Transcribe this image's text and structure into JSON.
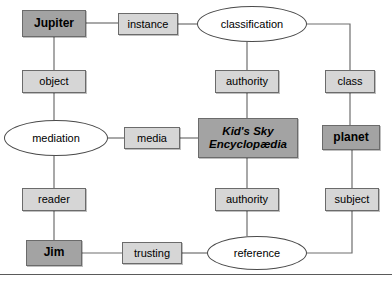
{
  "diagram": {
    "style": {
      "background": "#ffffff",
      "node_light_fill": "#d6d6d6",
      "node_dark_fill": "#a3a3a3",
      "ellipse_fill": "#ffffff",
      "edge_color": "#6e6e6e",
      "text_color": "#000000"
    },
    "nodes": [
      {
        "id": "jupiter",
        "label": "Jupiter",
        "shape": "box",
        "fill": "dark",
        "text": "bold",
        "x": 22,
        "y": 10,
        "w": 64,
        "h": 27
      },
      {
        "id": "instance",
        "label": "instance",
        "shape": "box",
        "fill": "light",
        "text": "plain",
        "x": 118,
        "y": 13,
        "w": 60,
        "h": 22
      },
      {
        "id": "classification",
        "label": "classification",
        "shape": "ellipse",
        "fill": "white",
        "text": "plain",
        "x": 197,
        "y": 6,
        "w": 110,
        "h": 36
      },
      {
        "id": "object",
        "label": "object",
        "shape": "box",
        "fill": "light",
        "text": "plain",
        "x": 22,
        "y": 70,
        "w": 64,
        "h": 23
      },
      {
        "id": "authority_top",
        "label": "authority",
        "shape": "box",
        "fill": "light",
        "text": "plain",
        "x": 215,
        "y": 70,
        "w": 64,
        "h": 23
      },
      {
        "id": "class",
        "label": "class",
        "shape": "box",
        "fill": "light",
        "text": "plain",
        "x": 325,
        "y": 70,
        "w": 50,
        "h": 23
      },
      {
        "id": "mediation",
        "label": "mediation",
        "shape": "ellipse",
        "fill": "white",
        "text": "plain",
        "x": 4,
        "y": 120,
        "w": 104,
        "h": 36
      },
      {
        "id": "media",
        "label": "media",
        "shape": "box",
        "fill": "light",
        "text": "plain",
        "x": 124,
        "y": 127,
        "w": 56,
        "h": 22
      },
      {
        "id": "encyclopaedia",
        "label": "Kid's Sky\nEncyclopædia",
        "shape": "box",
        "fill": "dark",
        "text": "bolditalic",
        "x": 198,
        "y": 118,
        "w": 100,
        "h": 40
      },
      {
        "id": "planet",
        "label": "planet",
        "shape": "box",
        "fill": "dark",
        "text": "bold",
        "x": 322,
        "y": 125,
        "w": 58,
        "h": 25
      },
      {
        "id": "reader",
        "label": "reader",
        "shape": "box",
        "fill": "light",
        "text": "plain",
        "x": 22,
        "y": 188,
        "w": 64,
        "h": 23
      },
      {
        "id": "authority_bot",
        "label": "authority",
        "shape": "box",
        "fill": "light",
        "text": "plain",
        "x": 215,
        "y": 188,
        "w": 64,
        "h": 23
      },
      {
        "id": "subject",
        "label": "subject",
        "shape": "box",
        "fill": "light",
        "text": "plain",
        "x": 325,
        "y": 188,
        "w": 54,
        "h": 23
      },
      {
        "id": "jim",
        "label": "Jim",
        "shape": "box",
        "fill": "dark",
        "text": "bold",
        "x": 26,
        "y": 240,
        "w": 56,
        "h": 26
      },
      {
        "id": "trusting",
        "label": "trusting",
        "shape": "box",
        "fill": "light",
        "text": "plain",
        "x": 122,
        "y": 242,
        "w": 60,
        "h": 22
      },
      {
        "id": "reference",
        "label": "reference",
        "shape": "ellipse",
        "fill": "white",
        "text": "plain",
        "x": 207,
        "y": 236,
        "w": 100,
        "h": 34
      }
    ],
    "edges": [
      {
        "id": "jupiter-instance",
        "from": "jupiter",
        "to": "instance",
        "path": "M 86,23 L 118,23"
      },
      {
        "id": "instance-classification",
        "from": "instance",
        "to": "classification",
        "path": "M 178,24 L 197,24"
      },
      {
        "id": "jupiter-object",
        "from": "jupiter",
        "to": "object",
        "path": "M 54,37 L 54,70"
      },
      {
        "id": "classification-authority",
        "from": "classification",
        "to": "authority_top",
        "path": "M 247,42 L 247,70"
      },
      {
        "id": "classification-class",
        "from": "classification",
        "to": "class",
        "path": "M 307,24 L 350,24 L 350,70"
      },
      {
        "id": "object-mediation",
        "from": "object",
        "to": "mediation",
        "path": "M 54,93 L 54,120"
      },
      {
        "id": "authority-encyclopaedia",
        "from": "authority_top",
        "to": "encyclopaedia",
        "path": "M 247,93 L 247,118"
      },
      {
        "id": "class-planet",
        "from": "class",
        "to": "planet",
        "path": "M 350,93 L 350,125"
      },
      {
        "id": "mediation-media",
        "from": "mediation",
        "to": "media",
        "path": "M 108,138 L 124,138"
      },
      {
        "id": "media-encyclopaedia",
        "from": "media",
        "to": "encyclopaedia",
        "path": "M 180,138 L 198,138"
      },
      {
        "id": "mediation-reader",
        "from": "mediation",
        "to": "reader",
        "path": "M 54,156 L 54,188"
      },
      {
        "id": "encyclopaedia-authority",
        "from": "encyclopaedia",
        "to": "authority_bot",
        "path": "M 247,158 L 247,188"
      },
      {
        "id": "planet-subject",
        "from": "planet",
        "to": "subject",
        "path": "M 352,150 L 352,188"
      },
      {
        "id": "reader-jim",
        "from": "reader",
        "to": "jim",
        "path": "M 54,211 L 54,240"
      },
      {
        "id": "authority-reference",
        "from": "authority_bot",
        "to": "reference",
        "path": "M 247,211 L 247,236"
      },
      {
        "id": "jim-trusting",
        "from": "jim",
        "to": "trusting",
        "path": "M 82,253 L 122,253"
      },
      {
        "id": "trusting-reference",
        "from": "trusting",
        "to": "reference",
        "path": "M 182,253 L 207,253"
      },
      {
        "id": "reference-subject",
        "from": "reference",
        "to": "subject",
        "path": "M 307,253 L 352,253 L 352,211"
      }
    ],
    "baseline": {
      "id": "bottom-rule",
      "y": 274
    }
  }
}
